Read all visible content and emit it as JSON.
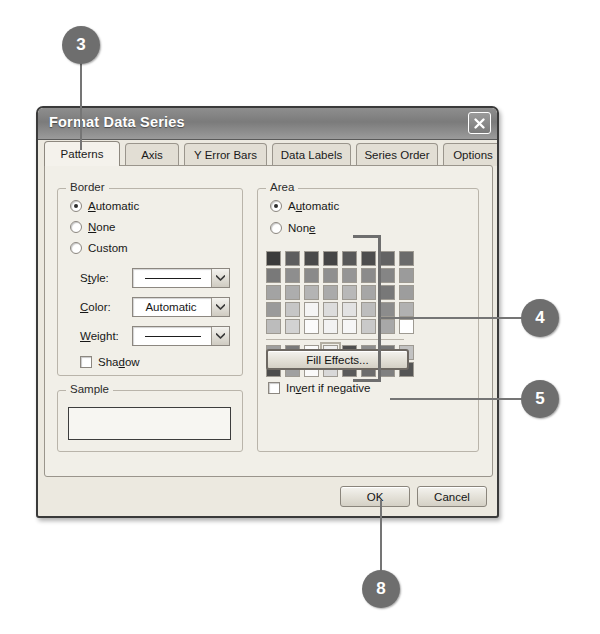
{
  "dialog": {
    "title": "Format Data Series",
    "close_icon": "close-x-icon",
    "tabs": [
      {
        "label": "Patterns",
        "active": true
      },
      {
        "label": "Axis",
        "active": false
      },
      {
        "label": "Y Error Bars",
        "active": false
      },
      {
        "label": "Data Labels",
        "active": false
      },
      {
        "label": "Series Order",
        "active": false
      },
      {
        "label": "Options",
        "active": false
      }
    ],
    "border_group": {
      "legend": "Border",
      "radios": [
        {
          "label": "Automatic",
          "accel": "A",
          "checked": true
        },
        {
          "label": "None",
          "accel": "N",
          "checked": false
        },
        {
          "label": "Custom",
          "accel": "",
          "checked": false
        }
      ],
      "fields": [
        {
          "label": "Style:",
          "accel": "t",
          "value": "",
          "display": "line"
        },
        {
          "label": "Color:",
          "accel": "C",
          "value": "Automatic",
          "display": "text"
        },
        {
          "label": "Weight:",
          "accel": "W",
          "value": "",
          "display": "line"
        }
      ],
      "shadow_checkbox": {
        "label": "Shadow",
        "accel": "d",
        "checked": false
      }
    },
    "sample_group": {
      "legend": "Sample",
      "value": ""
    },
    "area_group": {
      "legend": "Area",
      "radios": [
        {
          "label": "Automatic",
          "accel": "u",
          "checked": true
        },
        {
          "label": "None",
          "accel": "e",
          "checked": false
        }
      ],
      "fill_effects_button": "Fill Effects...",
      "invert_checkbox": {
        "label": "Invert if negative",
        "accel": "v",
        "checked": false
      },
      "palette": {
        "selected_index": 43,
        "main_rows": [
          [
            "#3b3b3b",
            "#5e5e5e",
            "#4a4a4a",
            "#454545",
            "#585858",
            "#4d4d4d",
            "#636363",
            "#6b6b6b"
          ],
          [
            "#797979",
            "#8e8e8e",
            "#8a8a8a",
            "#8f8f8f",
            "#959595",
            "#8b8b8b",
            "#858585",
            "#9b9b9b"
          ],
          [
            "#a3a3a3",
            "#adadad",
            "#b4b4b4",
            "#aaaaaa",
            "#b8b8b8",
            "#a6a6a6",
            "#787878",
            "#9d9d9d"
          ],
          [
            "#9a9a9a",
            "#c6c6c6",
            "#f4f4f4",
            "#dcdcdc",
            "#e2e2e2",
            "#bdbdbd",
            "#8c8c8c",
            "#b1b1b1"
          ],
          [
            "#bcbcbc",
            "#d2d2d2",
            "#fbfbfb",
            "#f2f2f2",
            "#f6f6f6",
            "#c9c9c9",
            "#a8a8a8",
            "#ffffff"
          ]
        ],
        "extra_rows": [
          [
            "#9e9e9e",
            "#7a7a7a",
            "#fbfbfb",
            "#efefef",
            "#4f4f4f",
            "#8d8d8d",
            "#757575",
            "#c2c2c2"
          ],
          [
            "#4c4c4c",
            "#a0a0a0",
            "#fafafa",
            "#d8d8d8",
            "#5a5a5a",
            "#6c6c6c",
            "#808080",
            "#555555"
          ]
        ]
      }
    },
    "footer": {
      "ok_label": "OK",
      "cancel_label": "Cancel"
    }
  },
  "callouts": [
    {
      "number": "3"
    },
    {
      "number": "4"
    },
    {
      "number": "5"
    },
    {
      "number": "8"
    }
  ],
  "colors": {
    "callout_fill": "#6e6e6e",
    "callout_text": "#ffffff",
    "leader_line": "#757575",
    "dialog_face": "#ece9e0",
    "tabpage_face": "#f1efe8",
    "titlebar": "#7b7b7b"
  }
}
